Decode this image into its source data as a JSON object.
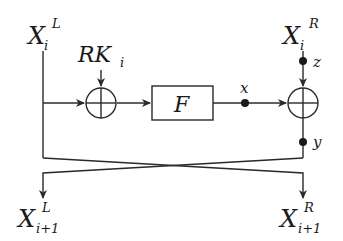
{
  "diagram": {
    "type": "feistel-round",
    "inputs": {
      "left": {
        "base": "X",
        "sub": "i",
        "sup": "L"
      },
      "right": {
        "base": "X",
        "sub": "i",
        "sup": "R"
      }
    },
    "round_key": {
      "base": "RK",
      "sub": "i"
    },
    "function_box": {
      "label": "F"
    },
    "operators": [
      {
        "id": "xor-1",
        "symbol": "⊕"
      },
      {
        "id": "xor-2",
        "symbol": "⊕"
      }
    ],
    "probe_points": [
      {
        "label": "x"
      },
      {
        "label": "z"
      },
      {
        "label": "y"
      }
    ],
    "outputs": {
      "left": {
        "base": "X",
        "sub": "i+1",
        "sup": "L"
      },
      "right": {
        "base": "X",
        "sub": "i+1",
        "sup": "R"
      }
    },
    "colors": {
      "line": "#2a2a2a",
      "background": "#ffffff"
    }
  }
}
